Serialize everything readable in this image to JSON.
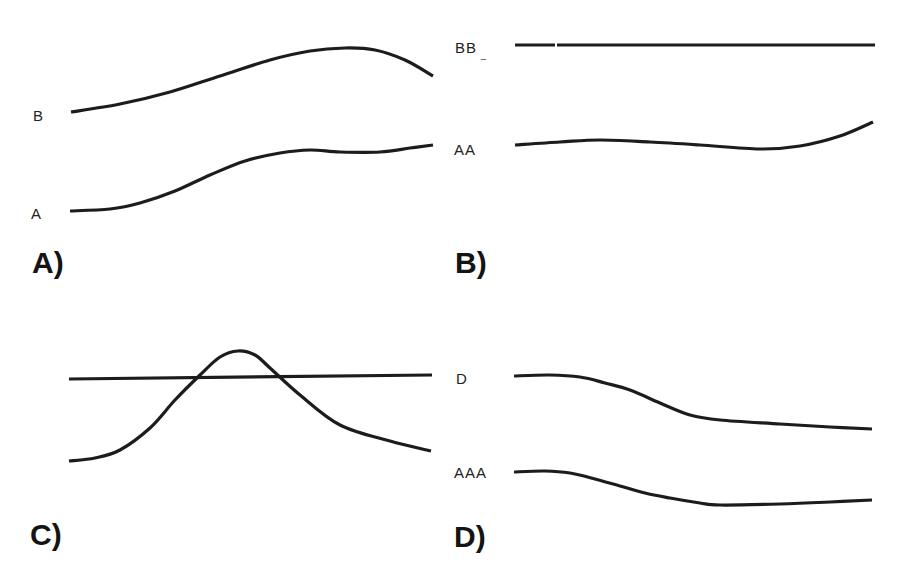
{
  "figure": {
    "stroke_color": "#1c1c1c",
    "background": "#ffffff",
    "panels": [
      {
        "id": "A",
        "label": "A)",
        "curves": [
          {
            "label": "B",
            "points": [
              [
                71,
                112
              ],
              [
                120,
                104
              ],
              [
                170,
                92
              ],
              [
                220,
                76
              ],
              [
                270,
                60
              ],
              [
                310,
                51
              ],
              [
                345,
                48
              ],
              [
                375,
                50
              ],
              [
                405,
                60
              ],
              [
                433,
                76
              ]
            ]
          },
          {
            "label": "A",
            "points": [
              [
                70,
                211
              ],
              [
                110,
                209
              ],
              [
                140,
                203
              ],
              [
                175,
                191
              ],
              [
                210,
                175
              ],
              [
                245,
                161
              ],
              [
                280,
                153
              ],
              [
                310,
                150
              ],
              [
                340,
                152
              ],
              [
                380,
                152
              ],
              [
                410,
                148
              ],
              [
                433,
                145
              ]
            ]
          }
        ]
      },
      {
        "id": "B",
        "label": "B)",
        "curves": [
          {
            "label": "BB_",
            "points": [
              [
                515,
                45
              ],
              [
                875,
                45
              ]
            ],
            "gap_at_x": 556
          },
          {
            "label": "AA",
            "points": [
              [
                515,
                145
              ],
              [
                560,
                142
              ],
              [
                600,
                140
              ],
              [
                650,
                142
              ],
              [
                700,
                145
              ],
              [
                760,
                149
              ],
              [
                800,
                146
              ],
              [
                840,
                136
              ],
              [
                873,
                122
              ]
            ]
          }
        ]
      },
      {
        "id": "C",
        "label": "C)",
        "curves": [
          {
            "label": "",
            "points": [
              [
                69,
                379
              ],
              [
                432,
                375
              ]
            ]
          },
          {
            "label": "",
            "points": [
              [
                69,
                461
              ],
              [
                95,
                458
              ],
              [
                120,
                450
              ],
              [
                150,
                428
              ],
              [
                175,
                400
              ],
              [
                200,
                375
              ],
              [
                220,
                357
              ],
              [
                238,
                351
              ],
              [
                255,
                355
              ],
              [
                270,
                368
              ],
              [
                300,
                395
              ],
              [
                340,
                425
              ],
              [
                390,
                441
              ],
              [
                431,
                451
              ]
            ]
          }
        ]
      },
      {
        "id": "D",
        "label": "D)",
        "curves": [
          {
            "label": "D",
            "points": [
              [
                514,
                376
              ],
              [
                550,
                375
              ],
              [
                580,
                377
              ],
              [
                605,
                383
              ],
              [
                630,
                390
              ],
              [
                660,
                403
              ],
              [
                690,
                415
              ],
              [
                720,
                420
              ],
              [
                780,
                424
              ],
              [
                830,
                427
              ],
              [
                872,
                429
              ]
            ]
          },
          {
            "label": "AAA",
            "points": [
              [
                514,
                472
              ],
              [
                545,
                471
              ],
              [
                570,
                473
              ],
              [
                595,
                479
              ],
              [
                620,
                486
              ],
              [
                645,
                493
              ],
              [
                670,
                498
              ],
              [
                700,
                503
              ],
              [
                720,
                505
              ],
              [
                780,
                504
              ],
              [
                830,
                502
              ],
              [
                872,
                500
              ]
            ]
          }
        ]
      }
    ]
  },
  "labels": {
    "panel_a": "A)",
    "panel_b": "B)",
    "panel_c": "C)",
    "panel_d": "D)",
    "curve_a_top": "B",
    "curve_a_bottom": "A",
    "curve_b_top": "BB",
    "curve_b_top_mark": "_",
    "curve_b_bottom": "AA",
    "curve_d_top": "D",
    "curve_d_bottom": "AAA"
  }
}
